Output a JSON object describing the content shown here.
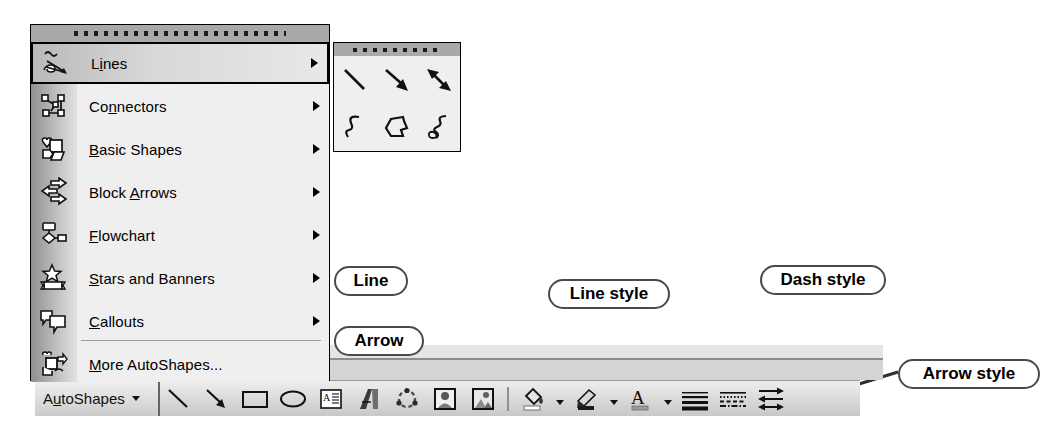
{
  "app": {
    "name": "Drawing toolbar and AutoShapes menu",
    "ui_style": "Microsoft Office 2003 Drawing toolbar"
  },
  "colors": {
    "menu_background": "#efefef",
    "menu_border": "#000000",
    "drag_bar": "#a9a9a9",
    "toolbar_face": "#dcdcdc",
    "separator": "#9a9a9a",
    "callout_border": "#4a4a4a",
    "text": "#000000"
  },
  "autoshapes_menu": {
    "drag_handle": "menu-drag-dots",
    "items": [
      {
        "label": "Lines",
        "accel": "i",
        "icon": "lines-icon",
        "has_submenu": true,
        "selected": true
      },
      {
        "label": "Connectors",
        "accel": "n",
        "icon": "connectors-icon",
        "has_submenu": true,
        "selected": false
      },
      {
        "label": "Basic Shapes",
        "accel": "B",
        "icon": "basic-shapes-icon",
        "has_submenu": true,
        "selected": false
      },
      {
        "label": "Block Arrows",
        "accel": "A",
        "icon": "block-arrows-icon",
        "has_submenu": true,
        "selected": false
      },
      {
        "label": "Flowchart",
        "accel": "F",
        "icon": "flowchart-icon",
        "has_submenu": true,
        "selected": false
      },
      {
        "label": "Stars and Banners",
        "accel": "S",
        "icon": "stars-banners-icon",
        "has_submenu": true,
        "selected": false
      },
      {
        "label": "Callouts",
        "accel": "C",
        "icon": "callouts-icon",
        "has_submenu": true,
        "selected": false
      },
      {
        "label": "More AutoShapes...",
        "accel": "M",
        "icon": "more-autoshapes-icon",
        "has_submenu": false,
        "selected": false
      }
    ]
  },
  "lines_submenu": {
    "drag_handle": "submenu-drag-dots",
    "tools": [
      {
        "name": "line-tool",
        "title": "Line"
      },
      {
        "name": "arrow-tool",
        "title": "Arrow"
      },
      {
        "name": "double-arrow-tool",
        "title": "Double Arrow"
      },
      {
        "name": "curve-tool",
        "title": "Curve"
      },
      {
        "name": "freeform-tool",
        "title": "Freeform"
      },
      {
        "name": "scribble-tool",
        "title": "Scribble"
      }
    ]
  },
  "drawing_toolbar": {
    "autoshapes_button": {
      "label": "AutoShapes",
      "accel": "u",
      "caret": "dropdown-caret"
    },
    "buttons": [
      {
        "name": "line-button",
        "label": "Line"
      },
      {
        "name": "arrow-button",
        "label": "Arrow"
      },
      {
        "name": "rectangle-button",
        "label": "Rectangle"
      },
      {
        "name": "oval-button",
        "label": "Oval"
      },
      {
        "name": "text-box-button",
        "label": "Text Box"
      },
      {
        "name": "wordart-button",
        "label": "Insert WordArt"
      },
      {
        "name": "diagram-button",
        "label": "Insert Diagram or Organization Chart"
      },
      {
        "name": "clip-art-button",
        "label": "Insert Clip Art"
      },
      {
        "name": "picture-button",
        "label": "Insert Picture"
      },
      {
        "name": "fill-color-button",
        "label": "Fill Color"
      },
      {
        "name": "line-color-button",
        "label": "Line Color"
      },
      {
        "name": "font-color-button",
        "label": "Font Color"
      },
      {
        "name": "line-style-button",
        "label": "Line Style"
      },
      {
        "name": "dash-style-button",
        "label": "Dash Style"
      },
      {
        "name": "arrow-style-button",
        "label": "Arrow Style"
      }
    ]
  },
  "callouts": [
    {
      "name": "callout-line",
      "text": "Line",
      "leader": "diagonal"
    },
    {
      "name": "callout-arrow",
      "text": "Arrow",
      "leader": "diagonal"
    },
    {
      "name": "callout-line-style",
      "text": "Line style",
      "leader": "diagonal"
    },
    {
      "name": "callout-dash-style",
      "text": "Dash style",
      "leader": "vertical"
    },
    {
      "name": "callout-arrow-style",
      "text": "Arrow style",
      "leader": "diagonal"
    }
  ]
}
